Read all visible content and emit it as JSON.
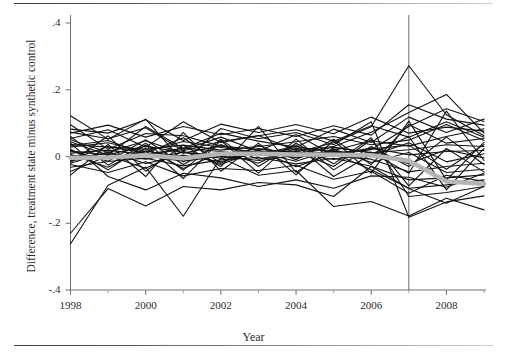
{
  "figure": {
    "background_color": "#ffffff",
    "rules": {
      "top_rule_label": "top-horizontal-rule",
      "bottom_rule_label": "bottom-horizontal-rule"
    }
  },
  "chart_data": {
    "type": "line",
    "title": "",
    "subtitle": "",
    "xlabel": "Year",
    "ylabel": "Difference, treatment state minus synthetic control",
    "xlim": [
      1998,
      2009
    ],
    "ylim": [
      -0.4,
      0.4
    ],
    "grid": false,
    "legend": "none",
    "x_ticks": [
      1998,
      2000,
      2002,
      2004,
      2006,
      2008
    ],
    "x_tick_labels": [
      "1998",
      "2000",
      "2002",
      "2004",
      "2006",
      "2008"
    ],
    "x_minor_ticks": [
      1999,
      2001,
      2003,
      2005,
      2007,
      2009
    ],
    "y_ticks": [
      0.4,
      0.2,
      0,
      -0.2,
      -0.4
    ],
    "y_tick_labels": [
      ".4",
      ".2",
      "0",
      "-.2",
      "-.4"
    ],
    "annotations": [
      {
        "name": "treatment-year-vertical-line",
        "type": "vline",
        "x": 2007,
        "color": "#6b6b6b"
      }
    ],
    "x": [
      1998,
      1999,
      2000,
      2001,
      2002,
      2003,
      2004,
      2005,
      2006,
      2007,
      2008,
      2009
    ],
    "series": [
      {
        "name": "mean-difference",
        "style": "thick-gray",
        "color": "#b5b5b5",
        "width": 4.5,
        "values": [
          -0.004,
          -0.003,
          0.004,
          -0.005,
          0.008,
          0.008,
          0.006,
          0.005,
          0.004,
          -0.013,
          -0.075,
          -0.082
        ]
      },
      {
        "name": "state-01",
        "style": "thin-black",
        "color": "#141414",
        "width": 1.1,
        "values": [
          0.095,
          0.022,
          0.069,
          0.062,
          0.031,
          0.021,
          0.013,
          0.041,
          0.089,
          0.272,
          0.125,
          0.062
        ]
      },
      {
        "name": "state-02",
        "style": "thin-black",
        "color": "#141414",
        "width": 1.1,
        "values": [
          0.073,
          0.053,
          0.086,
          0.017,
          0.045,
          0.063,
          0.018,
          0.03,
          0.073,
          0.132,
          0.186,
          0.07
        ]
      },
      {
        "name": "state-03",
        "style": "thin-black",
        "color": "#141414",
        "width": 1.1,
        "values": [
          0.05,
          0.012,
          0.047,
          0.01,
          0.032,
          0.008,
          0.03,
          0.011,
          0.02,
          0.09,
          0.143,
          0.105
        ]
      },
      {
        "name": "state-04",
        "style": "thin-black",
        "color": "#141414",
        "width": 1.1,
        "values": [
          0.036,
          0.028,
          0.022,
          0.034,
          0.019,
          0.03,
          0.044,
          0.06,
          0.035,
          0.049,
          0.096,
          0.048
        ]
      },
      {
        "name": "state-05",
        "style": "thin-black",
        "color": "#141414",
        "width": 1.1,
        "values": [
          0.028,
          0.041,
          0.015,
          0.045,
          0.027,
          0.011,
          0.024,
          0.018,
          0.047,
          0.031,
          0.06,
          0.083
        ]
      },
      {
        "name": "state-06",
        "style": "thin-black",
        "color": "#141414",
        "width": 1.1,
        "values": [
          0.016,
          0.005,
          0.031,
          0.012,
          0.004,
          0.024,
          0.009,
          0.028,
          0.011,
          0.02,
          0.035,
          0.03
        ]
      },
      {
        "name": "state-07",
        "style": "thin-black",
        "color": "#141414",
        "width": 1.1,
        "values": [
          0.01,
          0.019,
          0.006,
          0.025,
          0.015,
          0.002,
          0.021,
          0.006,
          0.025,
          0.005,
          0.015,
          0.018
        ]
      },
      {
        "name": "state-08",
        "style": "thin-black",
        "color": "#141414",
        "width": 1.1,
        "values": [
          0.004,
          -0.006,
          0.016,
          -0.002,
          0.008,
          0.017,
          -0.004,
          0.016,
          0.002,
          0.041,
          -0.016,
          0.008
        ]
      },
      {
        "name": "state-09",
        "style": "thin-black",
        "color": "#141414",
        "width": 1.1,
        "values": [
          -0.003,
          0.009,
          -0.008,
          0.013,
          -0.005,
          0.006,
          0.011,
          -0.009,
          0.013,
          -0.022,
          0.02,
          -0.004
        ]
      },
      {
        "name": "state-10",
        "style": "thin-black",
        "color": "#141414",
        "width": 1.1,
        "values": [
          -0.012,
          -0.002,
          0.002,
          -0.014,
          0.001,
          -0.012,
          0.003,
          0.001,
          -0.008,
          -0.046,
          -0.03,
          -0.02
        ]
      },
      {
        "name": "state-11",
        "style": "thin-black",
        "color": "#141414",
        "width": 1.1,
        "values": [
          -0.02,
          0.014,
          -0.021,
          0.004,
          -0.016,
          0.013,
          -0.014,
          0.022,
          -0.018,
          0.012,
          -0.048,
          -0.038
        ]
      },
      {
        "name": "state-12",
        "style": "thin-black",
        "color": "#141414",
        "width": 1.1,
        "values": [
          -0.032,
          -0.015,
          -0.005,
          -0.028,
          -0.01,
          -0.003,
          -0.022,
          -0.005,
          -0.029,
          -0.07,
          -0.064,
          -0.055
        ]
      },
      {
        "name": "state-13",
        "style": "thin-black",
        "color": "#141414",
        "width": 1.1,
        "values": [
          -0.045,
          0.002,
          -0.035,
          0.016,
          -0.024,
          0.019,
          -0.031,
          0.009,
          -0.04,
          -0.095,
          -0.085,
          -0.07
        ]
      },
      {
        "name": "state-14",
        "style": "thin-black",
        "color": "#141414",
        "width": 1.1,
        "values": [
          0.06,
          -0.026,
          0.04,
          -0.041,
          0.052,
          -0.03,
          0.04,
          -0.022,
          0.056,
          -0.12,
          -0.108,
          -0.09
        ]
      },
      {
        "name": "state-15",
        "style": "thin-black",
        "color": "#141414",
        "width": 1.1,
        "values": [
          0.122,
          0.052,
          0.112,
          -0.016,
          0.084,
          0.053,
          0.072,
          0.035,
          0.104,
          -0.182,
          -0.136,
          -0.118
        ]
      },
      {
        "name": "state-16",
        "style": "thin-black",
        "color": "#141414",
        "width": 1.1,
        "values": [
          -0.262,
          -0.086,
          -0.032,
          -0.179,
          -0.003,
          -0.056,
          -0.042,
          -0.15,
          -0.135,
          -0.178,
          -0.125,
          -0.16
        ]
      },
      {
        "name": "state-17",
        "style": "thin-black",
        "color": "#141414",
        "width": 1.1,
        "values": [
          -0.23,
          -0.096,
          -0.148,
          -0.09,
          -0.1,
          -0.078,
          -0.085,
          -0.12,
          -0.03,
          -0.096,
          -0.14,
          -0.09
        ]
      },
      {
        "name": "state-18",
        "style": "thin-black",
        "color": "#141414",
        "width": 1.1,
        "values": [
          0.04,
          -0.06,
          -0.1,
          -0.05,
          -0.064,
          -0.09,
          -0.07,
          -0.095,
          -0.058,
          -0.062,
          -0.092,
          -0.05
        ]
      },
      {
        "name": "state-19",
        "style": "thin-black",
        "color": "#141414",
        "width": 1.1,
        "values": [
          0.082,
          0.07,
          0.11,
          0.048,
          0.097,
          0.072,
          0.096,
          0.068,
          0.118,
          0.07,
          0.088,
          0.076
        ]
      },
      {
        "name": "state-20",
        "style": "thin-black",
        "color": "#141414",
        "width": 1.1,
        "values": [
          0.07,
          0.094,
          0.058,
          0.09,
          0.065,
          0.084,
          0.06,
          0.092,
          0.064,
          0.155,
          0.112,
          0.094
        ]
      },
      {
        "name": "state-21",
        "style": "thin-black",
        "color": "#141414",
        "width": 1.1,
        "values": [
          0.022,
          -0.04,
          0.035,
          -0.066,
          0.048,
          -0.05,
          0.052,
          -0.04,
          0.03,
          -0.03,
          0.058,
          -0.024
        ]
      },
      {
        "name": "state-22",
        "style": "thin-black",
        "color": "#141414",
        "width": 1.1,
        "values": [
          -0.056,
          0.036,
          -0.06,
          0.072,
          -0.044,
          0.04,
          -0.055,
          0.048,
          -0.05,
          0.106,
          -0.07,
          0.042
        ]
      },
      {
        "name": "state-23",
        "style": "thin-black",
        "color": "#141414",
        "width": 1.1,
        "values": [
          0.044,
          0.004,
          0.09,
          0.024,
          0.07,
          0.046,
          0.028,
          0.082,
          0.042,
          0.118,
          0.072,
          0.112
        ]
      },
      {
        "name": "state-24",
        "style": "thin-black",
        "color": "#141414",
        "width": 1.1,
        "values": [
          -0.018,
          0.062,
          -0.044,
          0.034,
          -0.03,
          0.09,
          -0.048,
          0.026,
          0.012,
          -0.05,
          0.136,
          -0.012
        ]
      },
      {
        "name": "state-25",
        "style": "thin-black",
        "color": "#141414",
        "width": 1.1,
        "values": [
          0.006,
          -0.032,
          0.024,
          -0.036,
          0.012,
          -0.02,
          0.035,
          -0.06,
          0.006,
          0.06,
          -0.1,
          0.024
        ]
      },
      {
        "name": "state-26",
        "style": "thin-black",
        "color": "#141414",
        "width": 1.1,
        "values": [
          -0.008,
          0.03,
          0.01,
          0.056,
          -0.02,
          0.034,
          -0.01,
          0.052,
          -0.024,
          0.096,
          0.04,
          0.054
        ]
      },
      {
        "name": "state-27",
        "style": "thin-black",
        "color": "#141414",
        "width": 1.1,
        "values": [
          0.018,
          -0.014,
          0.05,
          -0.024,
          0.036,
          -0.008,
          0.016,
          -0.03,
          0.05,
          -0.088,
          0.024,
          -0.046
        ]
      },
      {
        "name": "state-28",
        "style": "thin-black",
        "color": "#141414",
        "width": 1.1,
        "values": [
          0.032,
          0.048,
          0.006,
          0.02,
          0.058,
          0.016,
          0.066,
          0.004,
          0.022,
          0.034,
          -0.038,
          0.036
        ]
      },
      {
        "name": "state-29",
        "style": "thin-black",
        "color": "#141414",
        "width": 1.1,
        "values": [
          -0.024,
          -0.048,
          -0.016,
          -0.058,
          -0.036,
          -0.042,
          -0.026,
          -0.068,
          -0.044,
          -0.11,
          -0.056,
          -0.074
        ]
      },
      {
        "name": "state-30",
        "style": "thin-black",
        "color": "#141414",
        "width": 1.1,
        "values": [
          0.054,
          0.08,
          0.028,
          0.104,
          0.042,
          0.062,
          0.08,
          0.046,
          0.092,
          0.058,
          0.104,
          0.058
        ]
      }
    ]
  },
  "axes": {
    "x_title": "Year",
    "y_title": "Difference, treatment state minus synthetic control"
  }
}
